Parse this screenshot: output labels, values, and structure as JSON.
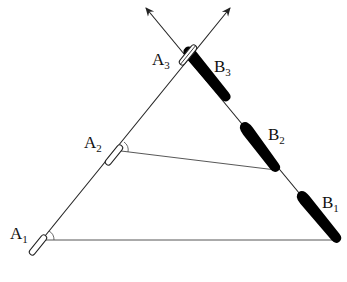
{
  "diagram": {
    "colors": {
      "line": "#222222",
      "boat_a_fill": "#ffffff",
      "boat_b_fill": "#000000",
      "background": "#ffffff"
    },
    "labels": {
      "A1": {
        "main": "A",
        "sub": "1"
      },
      "A2": {
        "main": "A",
        "sub": "2"
      },
      "A3": {
        "main": "A",
        "sub": "3"
      },
      "B1": {
        "main": "B",
        "sub": "1"
      },
      "B2": {
        "main": "B",
        "sub": "2"
      },
      "B3": {
        "main": "B",
        "sub": "3"
      }
    },
    "paths": [
      {
        "name": "path-a",
        "direction": "up-right",
        "arrow": true
      },
      {
        "name": "path-b",
        "direction": "up-left",
        "arrow": true
      }
    ],
    "sight_lines": [
      {
        "from": "A1",
        "to": "B1"
      },
      {
        "from": "A2",
        "to": "B2"
      }
    ]
  }
}
